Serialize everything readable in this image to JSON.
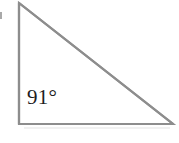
{
  "figure": {
    "kind": "geometry-figure",
    "shape": "right-triangle",
    "background_color": "#ffffff",
    "stroke_color": "#8d8d8d",
    "stroke_width": 2.2,
    "label_color": "#1d1d1d",
    "vertices": {
      "apex": {
        "x": 19,
        "y": 3
      },
      "bottom_left": {
        "x": 19,
        "y": 124
      },
      "bottom_right": {
        "x": 173,
        "y": 124
      }
    },
    "angle_label": {
      "text": "91°",
      "value": 91,
      "unit": "degrees",
      "at_vertex": "bottom-left"
    },
    "artifacts": {
      "left_edge_mark": "scan-speck",
      "below_baseline": "faint-scan-smudge"
    }
  }
}
